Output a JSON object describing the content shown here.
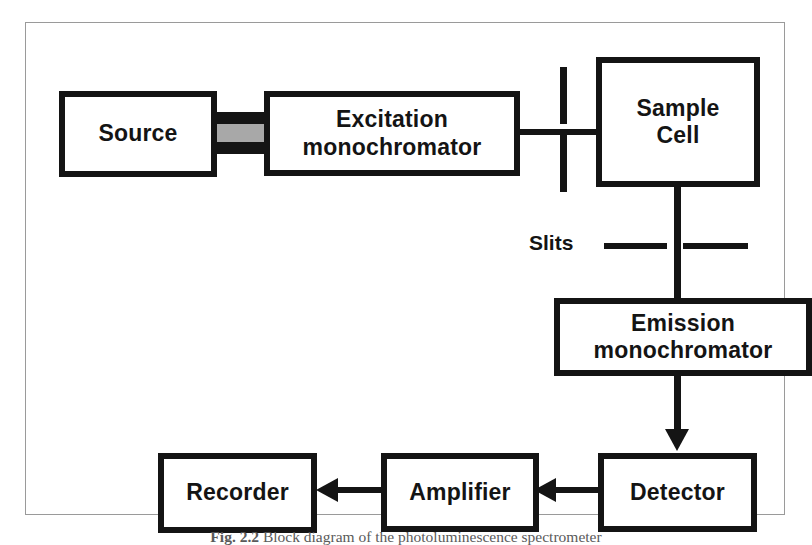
{
  "figure": {
    "caption_number": "Fig. 2.2",
    "caption_text": "Block diagram of the photoluminescence spectrometer",
    "slits_label": "Slits",
    "colors": {
      "block_border": "#141414",
      "block_fill": "#ffffff",
      "beam_core": "#a8a8a8",
      "frame_border": "#9a9a9a",
      "caption_text": "#5a5a5a"
    }
  },
  "blocks": {
    "source": "Source",
    "excitation_monochromator": "Excitation\nmonochromator",
    "sample_cell": "Sample\nCell",
    "emission_monochromator": "Emission\nmonochromator",
    "detector": "Detector",
    "amplifier": "Amplifier",
    "recorder": "Recorder"
  }
}
